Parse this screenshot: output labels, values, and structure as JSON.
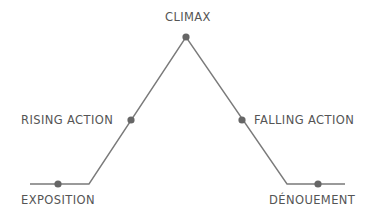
{
  "diagram": {
    "colors": {
      "line": "#7a7a7a",
      "point": "#666666",
      "text": "#555555"
    },
    "stages": [
      {
        "id": "exposition",
        "label": "EXPOSITION"
      },
      {
        "id": "rising-action",
        "label": "RISING ACTION"
      },
      {
        "id": "climax",
        "label": "CLIMAX"
      },
      {
        "id": "falling-action",
        "label": "FALLING ACTION"
      },
      {
        "id": "denouement",
        "label": "DÉNOUEMENT"
      }
    ]
  }
}
